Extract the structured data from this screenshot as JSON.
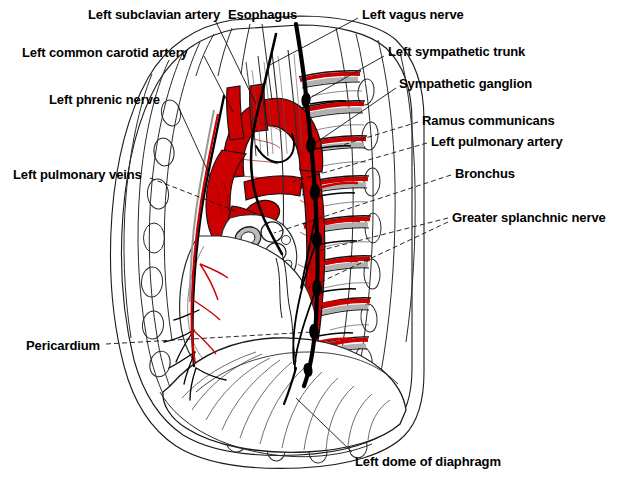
{
  "figure": {
    "background_color": "#ffffff",
    "ink_color": "#000000",
    "artery_color": "#cc0000",
    "cartilage_color": "#b4b4b4",
    "nerve_color": "#000000"
  },
  "labels": {
    "left_subclavian_artery": "Left subclavian artery",
    "esophagus": "Esophagus",
    "left_vagus_nerve": "Left vagus nerve",
    "left_common_carotid_artery": "Left common carotid artery",
    "left_sympathetic_trunk": "Left sympathetic trunk",
    "sympathetic_ganglion": "Sympathetic ganglion",
    "left_phrenic_nerve": "Left phrenic nerve",
    "ramus_communicans": "Ramus communicans",
    "left_pulmonary_artery": "Left pulmonary artery",
    "left_pulmonary_veins": "Left pulmonary veins",
    "bronchus": "Bronchus",
    "greater_splanchnic_nerve": "Greater splanchnic nerve",
    "pericardium": "Pericardium",
    "left_dome_of_diaphragm": "Left dome of diaphragm"
  },
  "label_positions": {
    "left_subclavian_artery": {
      "x": 88,
      "y": 7
    },
    "esophagus": {
      "x": 228,
      "y": 7
    },
    "left_vagus_nerve": {
      "x": 362,
      "y": 7
    },
    "left_common_carotid_artery": {
      "x": 22,
      "y": 45
    },
    "left_sympathetic_trunk": {
      "x": 388,
      "y": 44
    },
    "sympathetic_ganglion": {
      "x": 399,
      "y": 76
    },
    "left_phrenic_nerve": {
      "x": 49,
      "y": 92
    },
    "ramus_communicans": {
      "x": 422,
      "y": 113
    },
    "left_pulmonary_artery": {
      "x": 431,
      "y": 134
    },
    "left_pulmonary_veins": {
      "x": 13,
      "y": 167
    },
    "bronchus": {
      "x": 455,
      "y": 166
    },
    "greater_splanchnic_nerve": {
      "x": 452,
      "y": 210
    },
    "pericardium": {
      "x": 26,
      "y": 338
    },
    "left_dome_of_diaphragm": {
      "x": 355,
      "y": 454
    }
  }
}
